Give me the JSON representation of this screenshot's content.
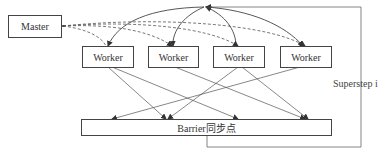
{
  "diagram": {
    "type": "bsp-superstep",
    "master": {
      "label": "Master"
    },
    "workers": [
      {
        "label": "Worker"
      },
      {
        "label": "Worker"
      },
      {
        "label": "Worker"
      },
      {
        "label": "Worker"
      }
    ],
    "barrier": {
      "label": "Barrier同步点"
    },
    "loop_label": "Superstep i",
    "edges": {
      "solid_curves_from_top_node_to_workers": [
        1,
        3
      ],
      "solid_curves_from_workers_to_top_node": [
        0,
        2
      ],
      "dashed_master_to_workers": [
        0,
        1,
        2,
        3
      ],
      "workers_to_barrier": "all-to-all crossing arrows",
      "loop": "barrier -> right side -> top node"
    }
  }
}
